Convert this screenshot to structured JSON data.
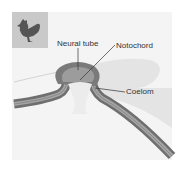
{
  "figure": {
    "icon": "chicken-icon",
    "labels": {
      "neural_tube": "Neural tube",
      "notochord": "Notochord",
      "coelom": "Coelom"
    },
    "colors": {
      "panel": "#f4f4f4",
      "icon_bg": "#c9c9c9",
      "icon_fg": "#555555",
      "tissue_dark": "#6a6a6a",
      "tissue_mid": "#a8a8a8",
      "yolk": "#e6e6e6"
    }
  }
}
